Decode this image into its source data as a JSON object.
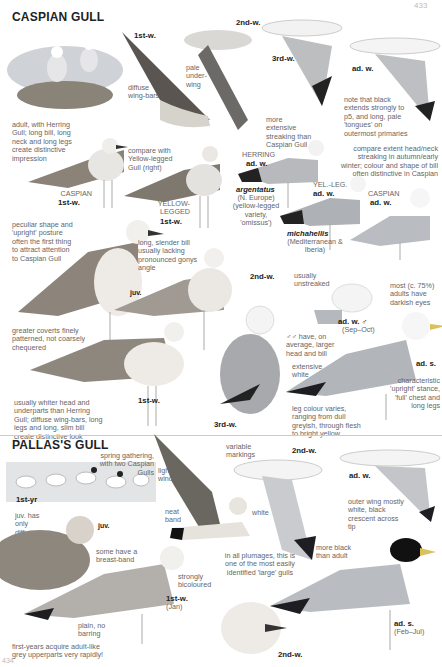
{
  "page": {
    "number_top": "433",
    "number_bottom": "434"
  },
  "caspian": {
    "title": "CASPIAN GULL",
    "labels": {
      "fly_1stw": "1st-w.",
      "fly_2ndw": "2nd-w.",
      "fly_3rdw": "3rd-w.",
      "fly_adw": "ad. w.",
      "stand_caspian_species": "CASPIAN",
      "stand_caspian_age": "1st-w.",
      "stand_yl_species": "YELLOW-LEGGED",
      "stand_yl_age": "1st-w.",
      "herring_species": "HERRING",
      "herring_age": "ad. w.",
      "argentatus": "argentatus",
      "argentatus_note": "(N. Europe) (yellow-legged variety, 'omissus')",
      "yelleg_species": "YEL.-LEG.",
      "yelleg_age": "ad. w.",
      "michahellis": "michahellis",
      "michahellis_note": "(Mediterranean & Iberia)",
      "casp_adw_species": "CASPIAN",
      "casp_adw_age": "ad. w.",
      "juv": "juv.",
      "second_w": "2nd-w.",
      "adw_male": "ad. w. ♂",
      "adw_male_sub": "(Sep–Oct)",
      "first_w_bottom": "1st-w.",
      "third_w": "3rd-w.",
      "ads": "ad. s."
    },
    "notes": {
      "diffuse_wingbars": "diffuse wing-bars",
      "pale_underwing": "pale under-wing",
      "adult_with_herring": "adult, with Herring Gull; long bill, long neck and long legs create distinctive impression",
      "more_streaking": "more extensive streaking than Caspian Gull",
      "note_black": "note that black extends strongly to p5, and long, pale 'tongues' on outermost primaries",
      "compare_yl": "compare with Yellow-legged Gull (right)",
      "compare_extent": "compare extent head/neck streaking in autumn/early winter; colour and shape of bill often distinctive in Caspian",
      "peculiar_shape": "peculiar shape and 'upright' posture often the first thing to attract attention to Caspian Gull",
      "long_slender_bill": "long, slender bill usually lacking pronounced gonys angle",
      "usually_unstreaked": "usually unstreaked",
      "dark_eyes": "most (c. 75%) adults have darkish eyes",
      "greater_coverts": "greater coverts finely patterned, not coarsely chequered",
      "males_larger": "♂♂ have, on average, larger head and bill",
      "extensive_white": "extensive white",
      "whiter_head": "usually whiter head and underparts than Herring Gull; diffuse wing-bars, long legs and long, slim bill create distinctive look",
      "leg_colour": "leg colour varies, ranging from dull greyish, through flesh to bright yellow",
      "upright_stance": "characteristic 'upright' stance, 'full' chest and long legs"
    }
  },
  "pallas": {
    "title": "PALLAS'S GULL",
    "labels": {
      "first_yr": "1st-yr",
      "juv": "juv.",
      "second_w_fly": "2nd-w.",
      "adw_fly": "ad. w.",
      "first_w": "1st-w.",
      "first_w_sub": "(Jan)",
      "ads": "ad. s.",
      "ads_sub": "(Feb–Jul)",
      "second_w": "2nd-w."
    },
    "notes": {
      "spring_gathering": "spring gathering, with two Caspian Gulls",
      "light_window": "light window",
      "variable_markings": "variable markings",
      "juv_mask": "juv. has only diffuse 'mask'",
      "neat_band": "neat band",
      "white": "white",
      "outer_wing": "outer wing mostly white, black crescent across tip",
      "breast_band": "some have a breast-band",
      "strongly_bicoloured": "strongly bicoloured",
      "all_plumages": "in all plumages, this is one of the most easily identified 'large' gulls",
      "more_black": "more black than adult",
      "plain_no_barring": "plain, no barring",
      "first_years": "first-years acquire adult-like grey upperparts very rapidly!"
    }
  },
  "colors": {
    "grey_mantle": "#b9bcc0",
    "dark_primary": "#1e1e22",
    "bill_yellow": "#d9c25a",
    "text": "#555555",
    "rule": "#cccccc"
  }
}
